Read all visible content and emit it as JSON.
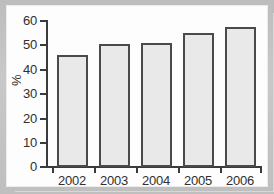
{
  "chart_data": {
    "type": "bar",
    "title": "",
    "subtitle": "",
    "xlabel": "",
    "ylabel": "%",
    "categories": [
      "2002",
      "2003",
      "2004",
      "2005",
      "2006"
    ],
    "values": [
      46,
      50.5,
      51,
      55,
      57.5
    ],
    "ylim": [
      0,
      60
    ],
    "ytick_labels": [
      "60",
      "50",
      "40",
      "30",
      "20",
      "10",
      "0"
    ],
    "ytick_values": [
      60,
      50,
      40,
      30,
      20,
      10,
      0
    ],
    "grid": false,
    "legend": null,
    "legend_position": "none",
    "series": [
      {
        "name": "",
        "values": [
          46,
          50.5,
          51,
          55,
          57.5
        ]
      }
    ],
    "annotations": []
  },
  "style": {
    "bar_fill": "#e9e9e9",
    "bar_edge": "#4a4a4a",
    "axis_color": "#3b3b3b",
    "text_color": "#303030",
    "panel_background": "#fdfdfd",
    "page_background": "#bdbdbd"
  }
}
